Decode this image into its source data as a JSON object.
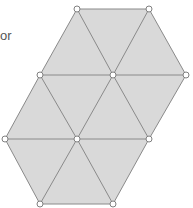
{
  "text": {
    "fragment": "or"
  },
  "colors": {
    "fill": "#d9d9d9",
    "stroke": "#8a8a8a",
    "vertex_fill": "#ffffff",
    "vertex_stroke": "#808080"
  },
  "diagram": {
    "type": "triangular-lattice-tiling",
    "outline": [
      [
        77,
        9
      ],
      [
        149,
        9
      ],
      [
        186,
        75
      ],
      [
        149,
        139
      ],
      [
        113,
        204
      ],
      [
        40,
        204
      ],
      [
        5,
        139
      ],
      [
        40,
        75
      ]
    ],
    "edges": [
      [
        [
          77,
          9
        ],
        [
          149,
          9
        ]
      ],
      [
        [
          149,
          9
        ],
        [
          186,
          75
        ]
      ],
      [
        [
          186,
          75
        ],
        [
          149,
          139
        ]
      ],
      [
        [
          149,
          139
        ],
        [
          113,
          204
        ]
      ],
      [
        [
          113,
          204
        ],
        [
          40,
          204
        ]
      ],
      [
        [
          40,
          204
        ],
        [
          5,
          139
        ]
      ],
      [
        [
          5,
          139
        ],
        [
          40,
          75
        ]
      ],
      [
        [
          40,
          75
        ],
        [
          77,
          9
        ]
      ],
      [
        [
          40,
          75
        ],
        [
          186,
          75
        ]
      ],
      [
        [
          5,
          139
        ],
        [
          149,
          139
        ]
      ],
      [
        [
          77,
          9
        ],
        [
          113,
          75
        ]
      ],
      [
        [
          149,
          9
        ],
        [
          113,
          75
        ]
      ],
      [
        [
          113,
          75
        ],
        [
          77,
          139
        ]
      ],
      [
        [
          113,
          75
        ],
        [
          149,
          139
        ]
      ],
      [
        [
          40,
          75
        ],
        [
          77,
          139
        ]
      ],
      [
        [
          77,
          139
        ],
        [
          40,
          204
        ]
      ],
      [
        [
          77,
          139
        ],
        [
          113,
          204
        ]
      ]
    ],
    "vertices": [
      [
        77,
        9
      ],
      [
        149,
        9
      ],
      [
        40,
        75
      ],
      [
        113,
        75
      ],
      [
        186,
        75
      ],
      [
        5,
        139
      ],
      [
        77,
        139
      ],
      [
        149,
        139
      ],
      [
        40,
        204
      ],
      [
        113,
        204
      ]
    ],
    "vertex_radius": 3
  }
}
